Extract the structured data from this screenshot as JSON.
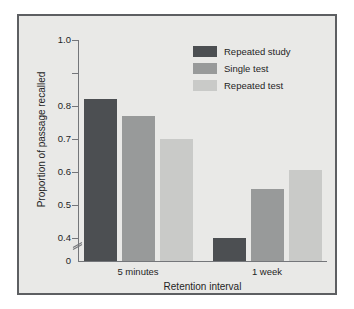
{
  "chart_data": {
    "type": "bar",
    "title": "",
    "xlabel": "Retention interval",
    "ylabel": "Proportion of passage recalled",
    "categories": [
      "5 minutes",
      "1 week"
    ],
    "series": [
      {
        "name": "Repeated study",
        "values": [
          0.82,
          0.4
        ],
        "color": "#4c4f52"
      },
      {
        "name": "Single test",
        "values": [
          0.77,
          0.55
        ],
        "color": "#989a9a"
      },
      {
        "name": "Repeated test",
        "values": [
          0.7,
          0.605
        ],
        "color": "#c9cac8"
      }
    ],
    "ylim": [
      0.35,
      1.0
    ],
    "y_ticks": [
      {
        "value": 1.0,
        "label": "1.0"
      },
      {
        "value": 0.9,
        "label": ""
      },
      {
        "value": 0.8,
        "label": "0.8"
      },
      {
        "value": 0.7,
        "label": "0.7"
      },
      {
        "value": 0.6,
        "label": "0.6"
      },
      {
        "value": 0.5,
        "label": "0.5"
      },
      {
        "value": 0.4,
        "label": "0.4"
      }
    ],
    "y_origin_label": "0",
    "axis_break": true,
    "axis_break_icon": "axis-break-slashes",
    "grid": false,
    "legend_position": "top-right",
    "legend_entries": [
      "Repeated study",
      "Single test",
      "Repeated test"
    ]
  },
  "figure": {
    "frame_color": "#5d5f62",
    "background_color": "#e9e9e7",
    "page_color": "#ffffff",
    "axis_color": "#74767a",
    "text_color": "#1f1f1f"
  }
}
